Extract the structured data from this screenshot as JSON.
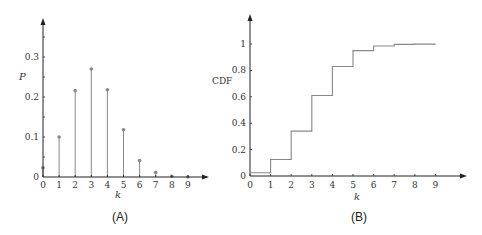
{
  "chart_data": [
    {
      "type": "bar",
      "subtype": "stem",
      "panel_label": "(A)",
      "title": "",
      "xlabel": "k",
      "ylabel": "P",
      "categories": [
        0,
        1,
        2,
        3,
        4,
        5,
        6,
        7,
        8,
        9
      ],
      "values": [
        0.023,
        0.1,
        0.216,
        0.27,
        0.218,
        0.118,
        0.041,
        0.011,
        0.002,
        0.0003
      ],
      "x_ticks": [
        "0",
        "1",
        "2",
        "3",
        "4",
        "5",
        "6",
        "7",
        "8",
        "9"
      ],
      "y_ticks": [
        "0",
        "0.1",
        "0.2",
        "0.3"
      ],
      "y_tick_values": [
        0,
        0.1,
        0.2,
        0.3
      ],
      "ylim": [
        0,
        0.39
      ],
      "xlim": [
        0,
        10.2
      ],
      "grid": false,
      "legend": null,
      "color": "#888888"
    },
    {
      "type": "line",
      "subtype": "step",
      "panel_label": "(B)",
      "title": "",
      "xlabel": "k",
      "ylabel": "CDF",
      "x": [
        0,
        1,
        2,
        3,
        4,
        5,
        6,
        7,
        8,
        9
      ],
      "values": [
        0.025,
        0.125,
        0.34,
        0.61,
        0.83,
        0.95,
        0.985,
        0.997,
        0.999,
        1.0
      ],
      "x_ticks": [
        "0",
        "1",
        "2",
        "3",
        "4",
        "5",
        "6",
        "7",
        "8",
        "9"
      ],
      "y_ticks": [
        "0",
        "0.2",
        "0.4",
        "0.6",
        "0.8",
        "1"
      ],
      "y_tick_values": [
        0,
        0.2,
        0.4,
        0.6,
        0.8,
        1
      ],
      "ylim": [
        0,
        1.22
      ],
      "xlim": [
        0,
        10.5
      ],
      "grid": false,
      "legend": null,
      "color": "#888888"
    }
  ],
  "labels": {
    "a": {
      "panel": "(A)",
      "xlabel": "k",
      "ylabel": "P"
    },
    "b": {
      "panel": "(B)",
      "xlabel": "k",
      "ylabel": "CDF"
    }
  }
}
